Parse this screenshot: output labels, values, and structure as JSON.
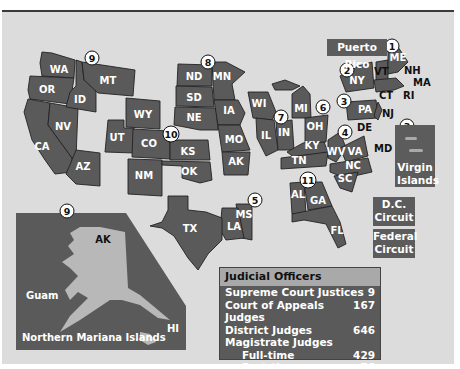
{
  "states": [
    {
      "abbr": "WA",
      "x": 47,
      "y": 70
    },
    {
      "abbr": "OR",
      "x": 45,
      "y": 92
    },
    {
      "abbr": "CA",
      "x": 44,
      "y": 147
    },
    {
      "abbr": "NV",
      "x": 62,
      "y": 128
    },
    {
      "abbr": "ID",
      "x": 80,
      "y": 103
    },
    {
      "abbr": "MT",
      "x": 108,
      "y": 84
    },
    {
      "abbr": "AZ",
      "x": 82,
      "y": 168
    },
    {
      "abbr": "UT",
      "x": 116,
      "y": 140
    },
    {
      "abbr": "WY",
      "x": 139,
      "y": 117
    },
    {
      "abbr": "CO",
      "x": 147,
      "y": 147
    },
    {
      "abbr": "NM",
      "x": 144,
      "y": 179
    },
    {
      "abbr": "KS",
      "x": 187,
      "y": 154
    },
    {
      "abbr": "OK",
      "x": 189,
      "y": 174
    },
    {
      "abbr": "ND",
      "x": 194,
      "y": 79
    },
    {
      "abbr": "SD",
      "x": 194,
      "y": 100
    },
    {
      "abbr": "NE",
      "x": 194,
      "y": 120
    },
    {
      "abbr": "MN",
      "x": 222,
      "y": 79
    },
    {
      "abbr": "IA",
      "x": 227,
      "y": 113
    },
    {
      "abbr": "MO",
      "x": 232,
      "y": 142
    },
    {
      "abbr": "AK",
      "x": 237,
      "y": 164
    },
    {
      "abbr": "WI",
      "x": 258,
      "y": 105
    },
    {
      "abbr": "IL",
      "x": 267,
      "y": 135
    },
    {
      "abbr": "IN",
      "x": 283,
      "y": 133
    },
    {
      "abbr": "MI",
      "x": 303,
      "y": 112
    },
    {
      "abbr": "OH",
      "x": 314,
      "y": 129
    },
    {
      "abbr": "KY",
      "x": 311,
      "y": 148
    },
    {
      "abbr": "TN",
      "x": 298,
      "y": 163
    },
    {
      "abbr": "WV",
      "x": 338,
      "y": 153
    },
    {
      "abbr": "VA",
      "x": 356,
      "y": 153
    },
    {
      "abbr": "NC",
      "x": 358,
      "y": 168
    },
    {
      "abbr": "SC",
      "x": 346,
      "y": 181
    },
    {
      "abbr": "NY",
      "x": 358,
      "y": 83
    },
    {
      "abbr": "PA",
      "x": 366,
      "y": 112
    },
    {
      "abbr": "ME",
      "x": 398,
      "y": 60
    },
    {
      "abbr": "AL",
      "x": 299,
      "y": 196
    },
    {
      "abbr": "GA",
      "x": 319,
      "y": 203
    },
    {
      "abbr": "FL",
      "x": 337,
      "y": 232
    },
    {
      "abbr": "TX",
      "x": 188,
      "y": 230
    },
    {
      "abbr": "LA",
      "x": 233,
      "y": 228
    },
    {
      "abbr": "MS",
      "x": 244,
      "y": 216
    }
  ],
  "outside_labels": [
    {
      "abbr": "VT",
      "x": 373,
      "y": 75
    },
    {
      "abbr": "NH",
      "x": 404,
      "y": 73
    },
    {
      "abbr": "MA",
      "x": 412,
      "y": 85
    },
    {
      "abbr": "CT",
      "x": 379,
      "y": 98
    },
    {
      "abbr": "RI",
      "x": 403,
      "y": 99
    },
    {
      "abbr": "NJ",
      "x": 384,
      "y": 116
    },
    {
      "abbr": "DE",
      "x": 356,
      "y": 131
    },
    {
      "abbr": "MD",
      "x": 373,
      "y": 152
    }
  ],
  "circuits": [
    {
      "num": "1",
      "x": 392,
      "y": 46
    },
    {
      "num": "2",
      "x": 347,
      "y": 70
    },
    {
      "num": "3",
      "x": 344,
      "y": 101
    },
    {
      "num": "3",
      "x": 407,
      "y": 126
    },
    {
      "num": "4",
      "x": 345,
      "y": 132
    },
    {
      "num": "5",
      "x": 255,
      "y": 200
    },
    {
      "num": "6",
      "x": 323,
      "y": 107
    },
    {
      "num": "7",
      "x": 281,
      "y": 117
    },
    {
      "num": "8",
      "x": 208,
      "y": 62
    },
    {
      "num": "9",
      "x": 92,
      "y": 58
    },
    {
      "num": "9",
      "x": 67,
      "y": 212
    },
    {
      "num": "10",
      "x": 171,
      "y": 134
    },
    {
      "num": "11",
      "x": 308,
      "y": 180
    }
  ],
  "territories": {
    "puerto_rico": "Puerto Rico",
    "virgin_islands": "Virgin Islands",
    "dc_circuit": "D.C. Circuit",
    "federal_circuit": "Federal Circuit"
  },
  "pacific_inset": {
    "alaska": "AK",
    "guam": "Guam",
    "hawaii": "HI",
    "northern_mariana": "Northern Mariana Islands"
  },
  "judicial_officers": {
    "title": "Judicial Officers",
    "rows": [
      {
        "label": "Supreme Court Justices",
        "value": "9"
      },
      {
        "label": "Court of Appeals Judges",
        "value": "167"
      },
      {
        "label": "District Judges",
        "value": "646"
      },
      {
        "label": "Magistrate Judges",
        "value": ""
      },
      {
        "label": "Full-time",
        "value": "429"
      },
      {
        "label": "Part-time",
        "value": "76"
      }
    ]
  }
}
